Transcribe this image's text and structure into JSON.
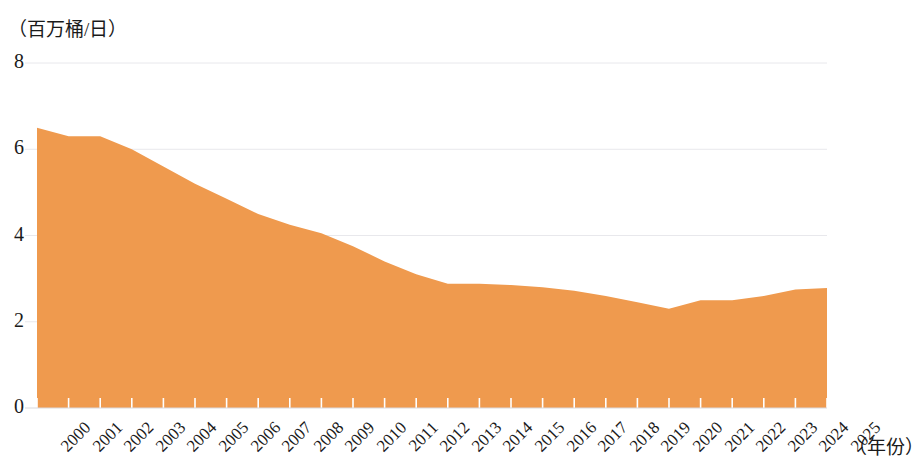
{
  "axes": {
    "y_unit_label": "（百万桶/日）",
    "x_unit_label": "（年份）",
    "y_ticks": [
      "0",
      "2",
      "4",
      "6",
      "8"
    ],
    "x_ticks": [
      "2000",
      "2001",
      "2002",
      "2003",
      "2004",
      "2005",
      "2006",
      "2007",
      "2008",
      "2009",
      "2010",
      "2011",
      "2012",
      "2013",
      "2014",
      "2015",
      "2016",
      "2017",
      "2018",
      "2019",
      "2020",
      "2021",
      "2022",
      "2023",
      "2024",
      "2025"
    ]
  },
  "style": {
    "area_fill": "#EF9A4E",
    "gridline_color": "#e8e8ec",
    "text_color": "#1a1a1a",
    "background": "#ffffff"
  },
  "chart_data": {
    "type": "area",
    "title": "",
    "subtitle": "",
    "xlabel": "（年份）",
    "ylabel": "（百万桶/日）",
    "xlim": [
      2000,
      2025
    ],
    "ylim": [
      0,
      8
    ],
    "yticks": [
      0,
      2,
      4,
      6,
      8
    ],
    "grid": true,
    "legend": false,
    "x": [
      2000,
      2001,
      2002,
      2003,
      2004,
      2005,
      2006,
      2007,
      2008,
      2009,
      2010,
      2011,
      2012,
      2013,
      2014,
      2015,
      2016,
      2017,
      2018,
      2019,
      2020,
      2021,
      2022,
      2023,
      2024,
      2025
    ],
    "categories": [
      "2000",
      "2001",
      "2002",
      "2003",
      "2004",
      "2005",
      "2006",
      "2007",
      "2008",
      "2009",
      "2010",
      "2011",
      "2012",
      "2013",
      "2014",
      "2015",
      "2016",
      "2017",
      "2018",
      "2019",
      "2020",
      "2021",
      "2022",
      "2023",
      "2024",
      "2025"
    ],
    "values": [
      6.5,
      6.3,
      6.3,
      6.0,
      5.6,
      5.2,
      4.85,
      4.5,
      4.25,
      4.05,
      3.75,
      3.4,
      3.1,
      2.88,
      2.88,
      2.85,
      2.8,
      2.72,
      2.6,
      2.45,
      2.3,
      2.5,
      2.5,
      2.6,
      2.75,
      2.78
    ],
    "series": [
      {
        "name": "",
        "values": [
          6.5,
          6.3,
          6.3,
          6.0,
          5.6,
          5.2,
          4.85,
          4.5,
          4.25,
          4.05,
          3.75,
          3.4,
          3.1,
          2.88,
          2.88,
          2.85,
          2.8,
          2.72,
          2.6,
          2.45,
          2.3,
          2.5,
          2.5,
          2.6,
          2.75,
          2.78
        ],
        "color": "#EF9A4E"
      }
    ]
  }
}
